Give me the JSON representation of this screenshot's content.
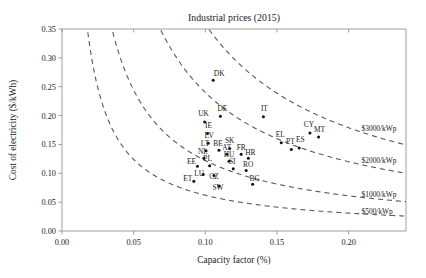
{
  "chart_data": {
    "type": "scatter",
    "title": "Industrial prices (2015)",
    "xlabel": "Capacity factor (%)",
    "ylabel": "Cost of electricity ($/kWh)",
    "xlim": [
      0.0,
      0.24
    ],
    "ylim": [
      0.0,
      0.35
    ],
    "xticks": [
      "0.00",
      "0.05",
      "0.10",
      "0.15",
      "0.20"
    ],
    "xtick_values": [
      0.0,
      0.05,
      0.1,
      0.15,
      0.2
    ],
    "yticks": [
      "0.00",
      "0.05",
      "0.10",
      "0.15",
      "0.20",
      "0.25",
      "0.30",
      "0.35"
    ],
    "ytick_values": [
      0.0,
      0.05,
      0.1,
      0.15,
      0.2,
      0.25,
      0.3,
      0.35
    ],
    "grid": false,
    "legend_position": "inline-right-of-curves",
    "point_color": "#111111",
    "curve_color": "#5a5a5a",
    "points": [
      {
        "label": "DK",
        "x": 0.1055,
        "y": 0.261,
        "lx": 6,
        "ly": -3
      },
      {
        "label": "DE",
        "x": 0.1105,
        "y": 0.199,
        "lx": 2,
        "ly": -4
      },
      {
        "label": "IT",
        "x": 0.1405,
        "y": 0.198,
        "lx": 1,
        "ly": -4
      },
      {
        "label": "UK",
        "x": 0.0995,
        "y": 0.189,
        "lx": -1,
        "ly": -4
      },
      {
        "label": "IE",
        "x": 0.1015,
        "y": 0.169,
        "lx": 1,
        "ly": -4
      },
      {
        "label": "CY",
        "x": 0.173,
        "y": 0.17,
        "lx": -1,
        "ly": -4
      },
      {
        "label": "MT",
        "x": 0.179,
        "y": 0.163,
        "lx": 1,
        "ly": -3
      },
      {
        "label": "LV",
        "x": 0.102,
        "y": 0.152,
        "lx": 1,
        "ly": -4
      },
      {
        "label": "EL",
        "x": 0.153,
        "y": 0.153,
        "lx": -1,
        "ly": -4
      },
      {
        "label": "PT",
        "x": 0.16,
        "y": 0.141,
        "lx": -1,
        "ly": -4
      },
      {
        "label": "ES",
        "x": 0.1655,
        "y": 0.144,
        "lx": 1,
        "ly": -4
      },
      {
        "label": "SK",
        "x": 0.117,
        "y": 0.143,
        "lx": 0,
        "ly": -4
      },
      {
        "label": "LT",
        "x": 0.1005,
        "y": 0.139,
        "lx": -1,
        "ly": -3
      },
      {
        "label": "BE",
        "x": 0.1095,
        "y": 0.14,
        "lx": -1,
        "ly": -3
      },
      {
        "label": "AT",
        "x": 0.115,
        "y": 0.133,
        "lx": 0,
        "ly": -3
      },
      {
        "label": "FR",
        "x": 0.125,
        "y": 0.133,
        "lx": 0,
        "ly": -3
      },
      {
        "label": "NL",
        "x": 0.099,
        "y": 0.126,
        "lx": -1,
        "ly": -3
      },
      {
        "label": "HR",
        "x": 0.13,
        "y": 0.126,
        "lx": 2,
        "ly": -2
      },
      {
        "label": "HU",
        "x": 0.1165,
        "y": 0.121,
        "lx": 0,
        "ly": -3
      },
      {
        "label": "EE",
        "x": 0.0945,
        "y": 0.112,
        "lx": -6,
        "ly": -1
      },
      {
        "label": "PL",
        "x": 0.103,
        "y": 0.113,
        "lx": -2,
        "ly": -3
      },
      {
        "label": "SI",
        "x": 0.1195,
        "y": 0.108,
        "lx": -1,
        "ly": -3
      },
      {
        "label": "RO",
        "x": 0.1285,
        "y": 0.105,
        "lx": 2,
        "ly": -2
      },
      {
        "label": "ET",
        "x": 0.092,
        "y": 0.086,
        "lx": -6,
        "ly": 1
      },
      {
        "label": "LU",
        "x": 0.0985,
        "y": 0.098,
        "lx": -4,
        "ly": 3
      },
      {
        "label": "CZ",
        "x": 0.106,
        "y": 0.096,
        "lx": 0,
        "ly": 5
      },
      {
        "label": "BG",
        "x": 0.133,
        "y": 0.081,
        "lx": 2,
        "ly": -2
      },
      {
        "label": "SW",
        "x": 0.1095,
        "y": 0.078,
        "lx": -1,
        "ly": 6
      }
    ],
    "curves": [
      {
        "label": "$3000/kWp",
        "constant": 0.0358,
        "label_x": 0.209,
        "label_y": 0.177
      },
      {
        "label": "$2000/kWp",
        "constant": 0.024,
        "label_x": 0.209,
        "label_y": 0.122
      },
      {
        "label": "$1000/kWp",
        "constant": 0.0122,
        "label_x": 0.209,
        "label_y": 0.064
      },
      {
        "label": "$500/kWp",
        "constant": 0.0062,
        "label_x": 0.209,
        "label_y": 0.034
      }
    ]
  }
}
